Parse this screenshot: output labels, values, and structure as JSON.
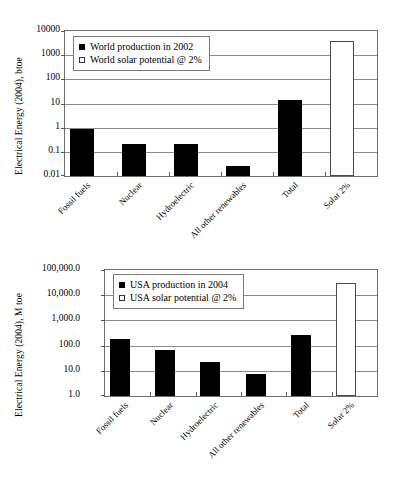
{
  "figures": [
    {
      "id": "world",
      "ylabel": "Electrical Energy (2004), btoe",
      "legend": [
        {
          "label": "World production in 2002",
          "style": "filled"
        },
        {
          "label": "World solar potential @ 2%",
          "style": "hollow"
        }
      ],
      "yticks": [
        "10000",
        "1000",
        "100",
        "10",
        "1",
        "0.1",
        "0.01"
      ],
      "categories": [
        "Fossil fuels",
        "Nuclear",
        "Hydroelectric",
        "All other renewables",
        "Total",
        "Solar 2%"
      ],
      "chart_data": {
        "type": "bar",
        "title": "",
        "xlabel": "",
        "ylabel": "Electrical Energy (2004), btoe",
        "yscale": "log",
        "ylim": [
          0.01,
          10000
        ],
        "ytick_values": [
          10000,
          1000,
          100,
          10,
          1,
          0.1,
          0.01
        ],
        "grid": true,
        "legend_position": "top-left",
        "categories": [
          "Fossil fuels",
          "Nuclear",
          "Hydroelectric",
          "All other renewables",
          "Total",
          "Solar 2%"
        ],
        "series": [
          {
            "name": "World production in 2002",
            "style": "filled",
            "values": [
              0.87,
              0.22,
              0.22,
              0.025,
              14,
              null
            ]
          },
          {
            "name": "World solar potential @ 2%",
            "style": "hollow",
            "values": [
              null,
              null,
              null,
              null,
              null,
              4000
            ]
          }
        ]
      }
    },
    {
      "id": "usa",
      "ylabel": "Electrical Energy (2004), M toe",
      "legend": [
        {
          "label": "USA production in 2004",
          "style": "filled"
        },
        {
          "label": "USA solar potential @ 2%",
          "style": "hollow"
        }
      ],
      "yticks": [
        "100,000.0",
        "10,000.0",
        "1,000.0",
        "100.0",
        "10.0",
        "1.0"
      ],
      "categories": [
        "Fossil fuels",
        "Nuclear",
        "Hydroelectric",
        "All other renewables",
        "Total",
        "Solar 2%"
      ],
      "chart_data": {
        "type": "bar",
        "title": "",
        "xlabel": "",
        "ylabel": "Electrical Energy (2004), M toe",
        "yscale": "log",
        "ylim": [
          1,
          100000
        ],
        "ytick_values": [
          100000,
          10000,
          1000,
          100,
          10,
          1
        ],
        "grid": true,
        "legend_position": "top-left",
        "categories": [
          "Fossil fuels",
          "Nuclear",
          "Hydroelectric",
          "All other renewables",
          "Total",
          "Solar 2%"
        ],
        "series": [
          {
            "name": "USA production in 2004",
            "style": "filled",
            "values": [
              185,
              68,
              23,
              7.5,
              270,
              null
            ]
          },
          {
            "name": "USA solar potential @ 2%",
            "style": "hollow",
            "values": [
              null,
              null,
              null,
              null,
              null,
              30000
            ]
          }
        ]
      }
    }
  ]
}
